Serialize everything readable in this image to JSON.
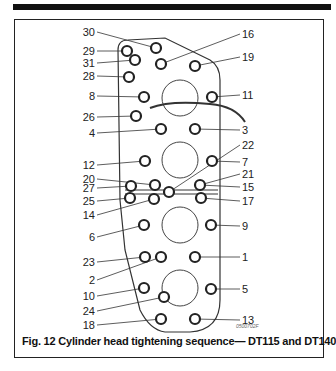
{
  "figure": {
    "caption": "Fig. 12 Cylinder head tightening sequence— DT115 and DT140",
    "code": "0500702F"
  },
  "bolts": {
    "left": [
      {
        "label": "30",
        "ly": 32,
        "bx": 156,
        "by": 48
      },
      {
        "label": "29",
        "ly": 51,
        "bx": 127,
        "by": 51
      },
      {
        "label": "31",
        "ly": 63,
        "bx": 135,
        "by": 60
      },
      {
        "label": "28",
        "ly": 76,
        "bx": 129,
        "by": 77
      },
      {
        "label": "8",
        "ly": 96,
        "bx": 144,
        "by": 97
      },
      {
        "label": "26",
        "ly": 117,
        "bx": 136,
        "by": 116
      },
      {
        "label": "4",
        "ly": 133,
        "bx": 161,
        "by": 129
      },
      {
        "label": "12",
        "ly": 165,
        "bx": 145,
        "by": 161
      },
      {
        "label": "20",
        "ly": 179,
        "bx": 155,
        "by": 185
      },
      {
        "label": "27",
        "ly": 188,
        "bx": 131,
        "by": 186
      },
      {
        "label": "25",
        "ly": 201,
        "bx": 130,
        "by": 198
      },
      {
        "label": "14",
        "ly": 215,
        "bx": 154,
        "by": 199
      },
      {
        "label": "6",
        "ly": 237,
        "bx": 144,
        "by": 225
      },
      {
        "label": "23",
        "ly": 262,
        "bx": 145,
        "by": 257
      },
      {
        "label": "2",
        "ly": 280,
        "bx": 161,
        "by": 257
      },
      {
        "label": "10",
        "ly": 296,
        "bx": 144,
        "by": 288
      },
      {
        "label": "24",
        "ly": 311,
        "bx": 164,
        "by": 297
      },
      {
        "label": "18",
        "ly": 325,
        "bx": 161,
        "by": 319
      }
    ],
    "right": [
      {
        "label": "16",
        "ly": 34,
        "bx": 161,
        "by": 64
      },
      {
        "label": "19",
        "ly": 57,
        "bx": 195,
        "by": 66
      },
      {
        "label": "11",
        "ly": 95,
        "bx": 212,
        "by": 97
      },
      {
        "label": "3",
        "ly": 130,
        "bx": 195,
        "by": 129
      },
      {
        "label": "22",
        "ly": 145,
        "bx": 169,
        "by": 192
      },
      {
        "label": "7",
        "ly": 162,
        "bx": 212,
        "by": 161
      },
      {
        "label": "21",
        "ly": 174,
        "bx": 200,
        "by": 185
      },
      {
        "label": "15",
        "ly": 187,
        "bx": 200,
        "by": 185
      },
      {
        "label": "17",
        "ly": 201,
        "bx": 201,
        "by": 198
      },
      {
        "label": "9",
        "ly": 226,
        "bx": 211,
        "by": 225
      },
      {
        "label": "1",
        "ly": 257,
        "bx": 195,
        "by": 257
      },
      {
        "label": "5",
        "ly": 289,
        "bx": 211,
        "by": 289
      },
      {
        "label": "13",
        "ly": 320,
        "bx": 195,
        "by": 319
      }
    ]
  }
}
